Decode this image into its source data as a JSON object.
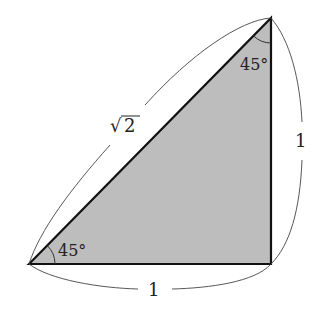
{
  "diagram": {
    "type": "right isosceles triangle",
    "fill_color": "#bdbdbd",
    "stroke_color": "#111111",
    "vertices": {
      "bottom_left": [
        29,
        264
      ],
      "top_right": [
        271,
        18
      ],
      "bottom_right": [
        271,
        264
      ]
    },
    "labels": {
      "hypotenuse": "√2",
      "hypotenuse_radical": "√",
      "hypotenuse_radicand": "2",
      "vertical_side": "1",
      "bottom_side": "1",
      "angle_bottom_left": "45°",
      "angle_top": "45°"
    }
  }
}
